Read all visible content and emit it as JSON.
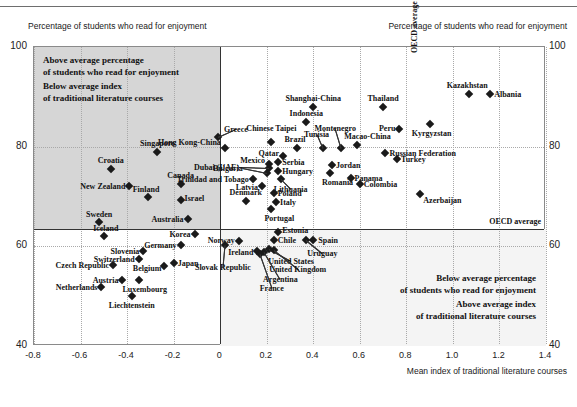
{
  "header": {
    "left_axis_caption": "Percentage of students who read for enjoyment",
    "right_axis_caption": "Percentage of students who read for enjoyment"
  },
  "annotations": {
    "upper_left": [
      "Above average percentage",
      "of students who read for enjoyment",
      "Below average index",
      "of traditional literature courses"
    ],
    "lower_right": [
      "Below average percentage",
      "of students who read for enjoyment",
      "Above average index",
      "of traditional literature courses"
    ],
    "oecd_vertical": "OECD average",
    "oecd_horizontal": "OECD average"
  },
  "chart_data": {
    "type": "scatter",
    "title": "",
    "xlabel": "Mean index of traditional literature courses",
    "ylabel": "Percentage of students who read for enjoyment",
    "xlim": [
      -0.8,
      1.4
    ],
    "ylim": [
      40,
      100
    ],
    "xticks": [
      "-0.8",
      "-0.6",
      "-0.4",
      "-0.2",
      "0",
      "0.2",
      "0.4",
      "0.6",
      "0.8",
      "1.0",
      "1.2",
      "1.4"
    ],
    "xtick_values": [
      -0.8,
      -0.6,
      -0.4,
      -0.2,
      0,
      0.2,
      0.4,
      0.6,
      0.8,
      1.0,
      1.2,
      1.4
    ],
    "yticks": [
      "100",
      "80",
      "60",
      "40"
    ],
    "ytick_values": [
      100,
      80,
      60,
      40
    ],
    "grid": true,
    "legend": "none",
    "reference_lines": {
      "x_oecd_average": 0.0,
      "y_oecd_average": 63.5
    },
    "marker_color": "#1a1a1a",
    "marker_shape": "diamond",
    "points": [
      {
        "name": "Singapore",
        "x": -0.27,
        "y": 79.0,
        "lp": "c",
        "ldx": 0,
        "ldy": -9
      },
      {
        "name": "Croatia",
        "x": -0.47,
        "y": 75.5,
        "lp": "c",
        "ldx": 0,
        "ldy": -9
      },
      {
        "name": "Canada",
        "x": -0.17,
        "y": 72.5,
        "lp": "c",
        "ldx": 0,
        "ldy": -9
      },
      {
        "name": "New Zealand",
        "x": -0.39,
        "y": 72.2,
        "lp": "l",
        "ldx": -4,
        "ldy": 0
      },
      {
        "name": "Finland",
        "x": -0.31,
        "y": 69.8,
        "lp": "c",
        "ldx": -2,
        "ldy": -8
      },
      {
        "name": "Israel",
        "x": -0.17,
        "y": 69.2,
        "lp": "r",
        "ldx": 4,
        "ldy": -2
      },
      {
        "name": "Australia",
        "x": -0.14,
        "y": 65.5,
        "lp": "l",
        "ldx": -4,
        "ldy": 0
      },
      {
        "name": "Sweden",
        "x": -0.52,
        "y": 64.8,
        "lp": "c",
        "ldx": 0,
        "ldy": -8
      },
      {
        "name": "Korea",
        "x": -0.11,
        "y": 62.5,
        "lp": "l",
        "ldx": -4,
        "ldy": 0
      },
      {
        "name": "Iceland",
        "x": -0.5,
        "y": 62.0,
        "lp": "c",
        "ldx": 2,
        "ldy": -8
      },
      {
        "name": "Germany",
        "x": -0.17,
        "y": 60.3,
        "lp": "l",
        "ldx": -4,
        "ldy": 0
      },
      {
        "name": "Slovenia",
        "x": -0.33,
        "y": 59.0,
        "lp": "l",
        "ldx": -4,
        "ldy": 0
      },
      {
        "name": "Switzerland",
        "x": -0.35,
        "y": 57.5,
        "lp": "l",
        "ldx": -4,
        "ldy": 0
      },
      {
        "name": "Czech Republic",
        "x": -0.46,
        "y": 56.3,
        "lp": "l",
        "ldx": -4,
        "ldy": 0
      },
      {
        "name": "Japan",
        "x": -0.2,
        "y": 56.7,
        "lp": "r",
        "ldx": 4,
        "ldy": 0
      },
      {
        "name": "Belgium",
        "x": -0.24,
        "y": 56.0,
        "lp": "l",
        "ldx": -3,
        "ldy": 2
      },
      {
        "name": "Austria",
        "x": -0.42,
        "y": 53.2,
        "lp": "l",
        "ldx": -4,
        "ldy": 0
      },
      {
        "name": "Luxembourg",
        "x": -0.35,
        "y": 53.2,
        "lp": "c",
        "ldx": 6,
        "ldy": 9
      },
      {
        "name": "Netherlands",
        "x": -0.51,
        "y": 51.8,
        "lp": "l",
        "ldx": -4,
        "ldy": 0
      },
      {
        "name": "Liechtenstein",
        "x": -0.38,
        "y": 50.1,
        "lp": "c",
        "ldx": 0,
        "ldy": 9
      },
      {
        "name": "Greece",
        "x": -0.01,
        "y": 82.0,
        "lp": "c",
        "ldx": 18,
        "ldy": -8
      },
      {
        "name": "Hong Kong-China",
        "x": 0.02,
        "y": 79.8,
        "lp": "l",
        "ldx": -4,
        "ldy": -6
      },
      {
        "name": "Chinese Taipei",
        "x": 0.22,
        "y": 81.0,
        "lp": "c",
        "ldx": 0,
        "ldy": -14
      },
      {
        "name": "Shanghai-China",
        "x": 0.4,
        "y": 88.0,
        "lp": "c",
        "ldx": 0,
        "ldy": -9
      },
      {
        "name": "Indonesia",
        "x": 0.37,
        "y": 85.0,
        "lp": "c",
        "ldx": 0,
        "ldy": -9
      },
      {
        "name": "Thailand",
        "x": 0.7,
        "y": 88.0,
        "lp": "c",
        "ldx": 0,
        "ldy": -9
      },
      {
        "name": "Kazakhstan",
        "x": 1.07,
        "y": 90.5,
        "lp": "c",
        "ldx": -2,
        "ldy": -9
      },
      {
        "name": "Albania",
        "x": 1.16,
        "y": 90.5,
        "lp": "r",
        "ldx": 4,
        "ldy": 0
      },
      {
        "name": "Kyrgyzstan",
        "x": 0.9,
        "y": 84.5,
        "lp": "c",
        "ldx": 2,
        "ldy": 9
      },
      {
        "name": "Peru",
        "x": 0.77,
        "y": 83.5,
        "lp": "l",
        "ldx": -4,
        "ldy": -1
      },
      {
        "name": "Montenegro",
        "x": 0.52,
        "y": 79.8,
        "lp": "c",
        "ldx": -6,
        "ldy": -20
      },
      {
        "name": "Tunisia",
        "x": 0.44,
        "y": 79.7,
        "lp": "c",
        "ldx": -6,
        "ldy": -14
      },
      {
        "name": "Brazil",
        "x": 0.33,
        "y": 79.7,
        "lp": "c",
        "ldx": -2,
        "ldy": -9
      },
      {
        "name": "Macao-China",
        "x": 0.59,
        "y": 80.3,
        "lp": "c",
        "ldx": 10,
        "ldy": -9
      },
      {
        "name": "Russian Federation",
        "x": 0.71,
        "y": 78.8,
        "lp": "r",
        "ldx": 4,
        "ldy": 0
      },
      {
        "name": "Turkey",
        "x": 0.76,
        "y": 77.5,
        "lp": "r",
        "ldx": 4,
        "ldy": 0
      },
      {
        "name": "Qatar",
        "x": 0.27,
        "y": 78.2,
        "lp": "l",
        "ldx": -4,
        "ldy": -3
      },
      {
        "name": "Serbia",
        "x": 0.25,
        "y": 77.0,
        "lp": "r",
        "ldx": 4,
        "ldy": 0
      },
      {
        "name": "Mexico",
        "x": 0.21,
        "y": 76.5,
        "lp": "l",
        "ldx": -4,
        "ldy": -4
      },
      {
        "name": "Hungary",
        "x": 0.25,
        "y": 75.2,
        "lp": "r",
        "ldx": 4,
        "ldy": 0
      },
      {
        "name": "Dubai (UAE)",
        "x": 0.21,
        "y": 75.8,
        "lp": "l",
        "ldx": -30,
        "ldy": -1
      },
      {
        "name": "Bulgaria",
        "x": 0.2,
        "y": 74.8,
        "lp": "l",
        "ldx": -24,
        "ldy": -5
      },
      {
        "name": "Jordan",
        "x": 0.48,
        "y": 76.3,
        "lp": "r",
        "ldx": 4,
        "ldy": 0
      },
      {
        "name": "Romania",
        "x": 0.47,
        "y": 74.8,
        "lp": "c",
        "ldx": 8,
        "ldy": 9
      },
      {
        "name": "Trinidad and Tobago",
        "x": 0.14,
        "y": 73.5,
        "lp": "l",
        "ldx": -4,
        "ldy": 0
      },
      {
        "name": "Panama",
        "x": 0.56,
        "y": 73.8,
        "lp": "r",
        "ldx": 4,
        "ldy": 0
      },
      {
        "name": "Colombia",
        "x": 0.6,
        "y": 72.5,
        "lp": "r",
        "ldx": 4,
        "ldy": 0
      },
      {
        "name": "Lithuania",
        "x": 0.26,
        "y": 73.5,
        "lp": "c",
        "ldx": 10,
        "ldy": 10
      },
      {
        "name": "Latvia",
        "x": 0.18,
        "y": 72.2,
        "lp": "l",
        "ldx": -4,
        "ldy": 1
      },
      {
        "name": "Poland",
        "x": 0.23,
        "y": 70.7,
        "lp": "r",
        "ldx": 4,
        "ldy": 0
      },
      {
        "name": "Italy",
        "x": 0.24,
        "y": 68.8,
        "lp": "r",
        "ldx": 4,
        "ldy": 0
      },
      {
        "name": "Portugal",
        "x": 0.22,
        "y": 67.5,
        "lp": "c",
        "ldx": 8,
        "ldy": 9
      },
      {
        "name": "Azerbaijan",
        "x": 0.86,
        "y": 70.5,
        "lp": "r",
        "ldx": 3,
        "ldy": 6
      },
      {
        "name": "Denmark",
        "x": 0.11,
        "y": 69.0,
        "lp": "c",
        "ldx": 0,
        "ldy": -9
      },
      {
        "name": "Estonia",
        "x": 0.25,
        "y": 62.8,
        "lp": "r",
        "ldx": 4,
        "ldy": -2
      },
      {
        "name": "Chile",
        "x": 0.23,
        "y": 61.3,
        "lp": "r",
        "ldx": 4,
        "ldy": 0
      },
      {
        "name": "Spain",
        "x": 0.4,
        "y": 61.2,
        "lp": "r",
        "ldx": 5,
        "ldy": 0
      },
      {
        "name": "Uruguay",
        "x": 0.37,
        "y": 61.2,
        "lp": "c",
        "ldx": 16,
        "ldy": 13
      },
      {
        "name": "Norway",
        "x": 0.08,
        "y": 61.0,
        "lp": "l",
        "ldx": -4,
        "ldy": -1
      },
      {
        "name": "Ireland",
        "x": 0.16,
        "y": 59.0,
        "lp": "l",
        "ldx": -4,
        "ldy": 1
      },
      {
        "name": "United States",
        "x": 0.21,
        "y": 59.5,
        "lp": "c",
        "ldx": 22,
        "ldy": 12
      },
      {
        "name": "United Kingdom",
        "x": 0.23,
        "y": 59.2,
        "lp": "c",
        "ldx": 24,
        "ldy": 19
      },
      {
        "name": "Argentina",
        "x": 0.19,
        "y": 58.8,
        "lp": "c",
        "ldx": 16,
        "ldy": 27
      },
      {
        "name": "France",
        "x": 0.17,
        "y": 58.5,
        "lp": "c",
        "ldx": 12,
        "ldy": 34
      },
      {
        "name": "Slovak Republic",
        "x": 0.02,
        "y": 60.2,
        "lp": "c",
        "ldx": -2,
        "ldy": 22
      }
    ]
  }
}
